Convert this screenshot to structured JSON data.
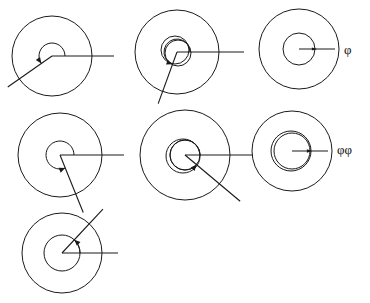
{
  "figure": {
    "background_color": "#ffffff",
    "stroke_color": "#1a1a1a",
    "width": 370,
    "height": 303,
    "labels": [
      {
        "id": "phi-single",
        "text": "φ",
        "x": 344,
        "y": 51
      },
      {
        "id": "phi-double",
        "text": "φφ",
        "x": 337,
        "y": 151
      }
    ],
    "diagrams": [
      {
        "id": "diagram-1",
        "position": "top-left",
        "center": {
          "x": 52,
          "y": 56
        },
        "outer_radius": 40,
        "inner_circles": [],
        "arc": {
          "radius": 13,
          "start_deg": 0,
          "end_deg": 215,
          "sweep": "ccw"
        },
        "rays": [
          {
            "id": "baseline-ray",
            "angle_deg": 0,
            "length": 62,
            "arrow": false
          },
          {
            "id": "angle-ray",
            "angle_deg": 215,
            "length": 54,
            "arrow": false
          }
        ],
        "arrow_at_arc_end": true
      },
      {
        "id": "diagram-2",
        "position": "top-middle",
        "center": {
          "x": 177,
          "y": 52
        },
        "outer_radius": 42,
        "inner_circles": [
          {
            "radius": 14,
            "offset_x": -2,
            "offset_y": -2
          },
          {
            "radius": 13,
            "offset_x": 1,
            "offset_y": 1
          }
        ],
        "arc": {
          "radius": 13,
          "start_deg": 0,
          "end_deg": 250,
          "sweep": "ccw"
        },
        "rays": [
          {
            "id": "baseline-ray",
            "angle_deg": 0,
            "length": 67,
            "arrow": false
          },
          {
            "id": "angle-ray",
            "angle_deg": 250,
            "length": 55,
            "arrow": false
          }
        ],
        "arrow_at_arc_end": true
      },
      {
        "id": "diagram-3",
        "position": "top-right",
        "center": {
          "x": 299,
          "y": 49
        },
        "outer_radius": 40,
        "inner_circles": [
          {
            "radius": 16,
            "offset_x": 0,
            "offset_y": 0
          }
        ],
        "arc": null,
        "rays": [
          {
            "id": "baseline-ray",
            "angle_deg": 0,
            "length": 36,
            "arrow": true
          }
        ],
        "arrow_at_arc_end": false
      },
      {
        "id": "diagram-4",
        "position": "middle-left",
        "center": {
          "x": 60,
          "y": 155
        },
        "outer_radius": 42,
        "inner_circles": [],
        "arc": {
          "radius": 14,
          "start_deg": 0,
          "end_deg": 292,
          "sweep": "ccw"
        },
        "rays": [
          {
            "id": "baseline-ray",
            "angle_deg": 0,
            "length": 64,
            "arrow": false
          },
          {
            "id": "angle-ray",
            "angle_deg": 292,
            "length": 62,
            "arrow": false
          }
        ],
        "arrow_at_arc_end": true
      },
      {
        "id": "diagram-5",
        "position": "middle-center",
        "center": {
          "x": 185,
          "y": 155
        },
        "outer_radius": 45,
        "inner_circles": [
          {
            "radius": 15,
            "offset_x": 0,
            "offset_y": 0
          },
          {
            "radius": 17,
            "offset_x": -2,
            "offset_y": 1
          }
        ],
        "arc": {
          "radius": 15,
          "start_deg": 0,
          "end_deg": 320,
          "sweep": "ccw"
        },
        "rays": [
          {
            "id": "baseline-ray",
            "angle_deg": 0,
            "length": 68,
            "arrow": false
          },
          {
            "id": "angle-ray",
            "angle_deg": 320,
            "length": 72,
            "arrow": false
          }
        ],
        "arrow_at_arc_end": true
      },
      {
        "id": "diagram-6",
        "position": "middle-right",
        "center": {
          "x": 292,
          "y": 151
        },
        "outer_radius": 40,
        "inner_circles": [
          {
            "radius": 18,
            "offset_x": 0,
            "offset_y": 0
          },
          {
            "radius": 20,
            "offset_x": -1,
            "offset_y": 0
          }
        ],
        "arc": null,
        "rays": [
          {
            "id": "baseline-ray",
            "angle_deg": 0,
            "length": 36,
            "arrow": true
          }
        ],
        "arrow_at_arc_end": false
      },
      {
        "id": "diagram-7",
        "position": "bottom-left",
        "center": {
          "x": 62,
          "y": 253
        },
        "outer_radius": 40,
        "inner_circles": [
          {
            "radius": 18,
            "offset_x": 0,
            "offset_y": 0
          }
        ],
        "arc": {
          "radius": 18,
          "start_deg": 0,
          "end_deg": 47,
          "sweep": "ccw"
        },
        "rays": [
          {
            "id": "baseline-ray",
            "angle_deg": 0,
            "length": 56,
            "arrow": false
          },
          {
            "id": "angle-ray",
            "angle_deg": 47,
            "length": 60,
            "arrow": false
          }
        ],
        "arrow_at_arc_end": true
      }
    ]
  }
}
